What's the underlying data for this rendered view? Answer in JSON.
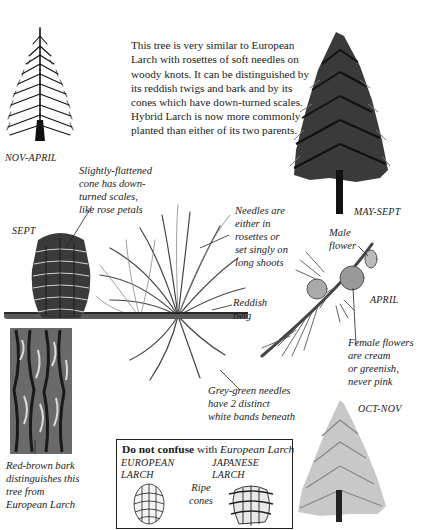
{
  "intro_text": "This tree is very similar to European Larch with rosettes of soft needles on woody knots. It can be distinguished by its reddish twigs and bark and by its cones which have down-turned scales. Hybrid Larch is now more commonly planted than either of its two parents.",
  "seasons": {
    "winter": "NOV-APRIL",
    "summer": "MAY-SEPT",
    "cone": "SEPT",
    "flowers": "APRIL",
    "autumn": "OCT-NOV"
  },
  "annotations": {
    "cone": [
      "Slightly-flattened",
      "cone has down-",
      "turned scales,",
      "like rose petals"
    ],
    "needles": [
      "Needles are",
      "either in",
      "rosettes or",
      "set singly on",
      "long shoots"
    ],
    "twig": [
      "Reddish",
      "twig"
    ],
    "male_flower": [
      "Male",
      "flower"
    ],
    "female_flowers": [
      "Female flowers",
      "are cream",
      "or greenish,",
      "never pink"
    ],
    "grey_needles": [
      "Grey-green needles",
      "have 2 distinct",
      "white bands beneath"
    ],
    "bark": [
      "Red-brown bark",
      "distinguishes this",
      "tree from",
      "European Larch"
    ]
  },
  "confuse_box": {
    "bold": "Do not confuse",
    "plain": " with ",
    "italic": "European Larch",
    "left_caption": [
      "EUROPEAN",
      "LARCH"
    ],
    "right_caption": [
      "JAPANESE",
      "LARCH"
    ],
    "middle_caption": [
      "Ripe",
      "cones"
    ]
  },
  "colors": {
    "ink": "#1a1a1a",
    "paper": "#ffffff"
  }
}
